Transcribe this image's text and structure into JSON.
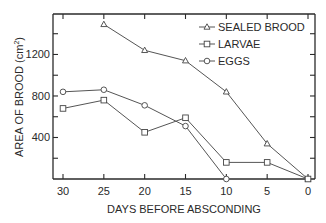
{
  "chart_data": {
    "type": "line",
    "title": "",
    "xlabel": "DAYS BEFORE ABSCONDING",
    "ylabel": "AREA OF BROOD (cm²)",
    "ylabel_main": "AREA OF BROOD (cm",
    "ylabel_sup": "2",
    "ylabel_close": ")",
    "x": [
      30,
      25,
      20,
      15,
      10,
      5,
      0
    ],
    "x_ticks": [
      30,
      25,
      20,
      15,
      10,
      5,
      0
    ],
    "x_tick_labels": [
      "30",
      "25",
      "20",
      "15",
      "10",
      "5",
      "0"
    ],
    "xlim": [
      30,
      0
    ],
    "x_reversed": true,
    "y_ticks_labeled": [
      400,
      800,
      1200
    ],
    "y_tick_labels": [
      "400",
      "800",
      "1200"
    ],
    "y_ticks_minor": [
      200,
      600,
      1000,
      1400
    ],
    "ylim": [
      0,
      1590
    ],
    "grid": false,
    "legend_position": "upper right (inside)",
    "series": [
      {
        "name": "SEALED BROOD",
        "marker": "triangle",
        "x": [
          25,
          20,
          15,
          10,
          5,
          0
        ],
        "values": [
          1490,
          1240,
          1140,
          840,
          340,
          0
        ]
      },
      {
        "name": "LARVAE",
        "marker": "square",
        "x": [
          30,
          25,
          20,
          15,
          10,
          5,
          0
        ],
        "values": [
          680,
          760,
          450,
          590,
          160,
          160,
          0
        ]
      },
      {
        "name": "EGGS",
        "marker": "circle",
        "x": [
          30,
          25,
          20,
          15,
          10
        ],
        "values": [
          840,
          860,
          710,
          510,
          0
        ]
      }
    ]
  }
}
